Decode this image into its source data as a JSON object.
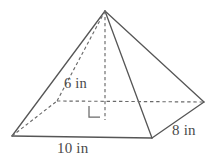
{
  "figure": {
    "name": "rectangular-pyramid",
    "stroke_color": "#565656",
    "dash_color": "#6a6a6a",
    "text_color": "#4a4a4a",
    "background_color": "#ffffff"
  },
  "labels": {
    "height": "6 in",
    "base_length": "10 in",
    "base_width": "8 in"
  },
  "geometry": {
    "apex": {
      "x": 105,
      "y": 11
    },
    "base_front_left": {
      "x": 12,
      "y": 136
    },
    "base_front_right": {
      "x": 152,
      "y": 138
    },
    "base_back_right": {
      "x": 204,
      "y": 102
    },
    "base_back_left": {
      "x": 57,
      "y": 101
    },
    "height_foot": {
      "x": 105,
      "y": 120
    },
    "right_angle_marker": {
      "x": 89,
      "y": 106,
      "size": 11
    },
    "solid_edges": [
      [
        105,
        11,
        12,
        136
      ],
      [
        105,
        11,
        152,
        138
      ],
      [
        105,
        11,
        204,
        102
      ],
      [
        12,
        136,
        152,
        138
      ],
      [
        152,
        138,
        204,
        102
      ]
    ],
    "dashed_edges": [
      [
        105,
        11,
        57,
        101
      ],
      [
        12,
        136,
        57,
        101
      ],
      [
        57,
        101,
        204,
        102
      ],
      [
        105,
        11,
        105,
        120
      ]
    ]
  }
}
